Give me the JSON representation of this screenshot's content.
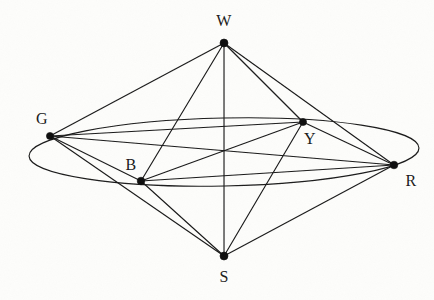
{
  "figure": {
    "width": 434,
    "height": 300,
    "background_color": "#fdfdfb",
    "ink_color": "#1a1a1a"
  },
  "nodes": [
    {
      "id": "W",
      "label": "W",
      "x": 224,
      "y": 43,
      "label_x": 224,
      "label_y": 21,
      "radius": 4.0
    },
    {
      "id": "G",
      "label": "G",
      "x": 50,
      "y": 136,
      "label_x": 42,
      "label_y": 119,
      "radius": 3.6
    },
    {
      "id": "Y",
      "label": "Y",
      "x": 303,
      "y": 122,
      "label_x": 310,
      "label_y": 139,
      "radius": 3.6
    },
    {
      "id": "B",
      "label": "B",
      "x": 141,
      "y": 181,
      "label_x": 131,
      "label_y": 165,
      "radius": 3.8
    },
    {
      "id": "R",
      "label": "R",
      "x": 394,
      "y": 165,
      "label_x": 411,
      "label_y": 181,
      "radius": 3.8
    },
    {
      "id": "S",
      "label": "S",
      "x": 224,
      "y": 256,
      "label_x": 224,
      "label_y": 277,
      "radius": 4.0
    }
  ],
  "edges": [
    {
      "from": "W",
      "to": "G"
    },
    {
      "from": "W",
      "to": "B"
    },
    {
      "from": "W",
      "to": "Y"
    },
    {
      "from": "W",
      "to": "R"
    },
    {
      "from": "W",
      "to": "S"
    },
    {
      "from": "G",
      "to": "B"
    },
    {
      "from": "G",
      "to": "Y"
    },
    {
      "from": "G",
      "to": "R"
    },
    {
      "from": "G",
      "to": "S"
    },
    {
      "from": "B",
      "to": "Y"
    },
    {
      "from": "B",
      "to": "R"
    },
    {
      "from": "B",
      "to": "S"
    },
    {
      "from": "Y",
      "to": "R"
    },
    {
      "from": "Y",
      "to": "S"
    },
    {
      "from": "R",
      "to": "S"
    }
  ],
  "ellipse": {
    "center_x": 224,
    "center_y": 152,
    "radius_x": 195,
    "radius_y": 34,
    "rotation_deg": -1.2
  },
  "graph_summary": {
    "vertex_count": 6,
    "edge_count": 15,
    "vertex_labels": [
      "W",
      "G",
      "Y",
      "B",
      "R",
      "S"
    ]
  }
}
